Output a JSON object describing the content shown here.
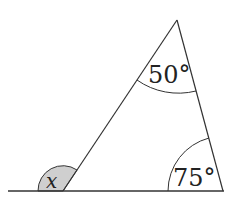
{
  "diagram": {
    "type": "triangle-exterior-angle",
    "colors": {
      "stroke": "#333333",
      "shade": "#cfcfcf",
      "text": "#222222",
      "background": "#ffffff"
    },
    "baseline": {
      "x1": 8,
      "y1": 191,
      "x2": 224,
      "y2": 191
    },
    "vertices": {
      "apex": {
        "x": 177,
        "y": 20
      },
      "bottom_left": {
        "x": 63,
        "y": 191
      },
      "bottom_right": {
        "x": 223,
        "y": 191
      }
    },
    "angles": [
      {
        "id": "apex",
        "label": "50°",
        "value": 50
      },
      {
        "id": "bottom_right",
        "label": "75°",
        "value": 75
      },
      {
        "id": "exterior",
        "label": "x",
        "value": null,
        "shaded": true
      }
    ],
    "labels": {
      "apex_angle": "50°",
      "right_angle": "75°",
      "exterior_angle": "x"
    }
  }
}
